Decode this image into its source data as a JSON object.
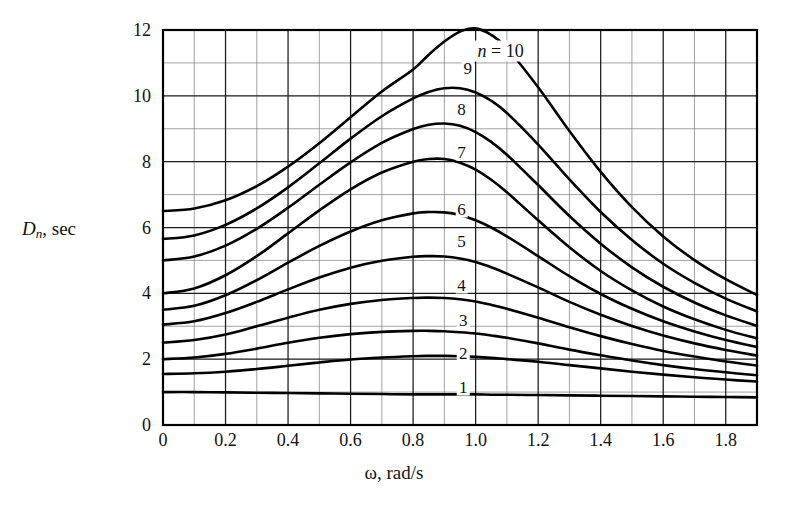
{
  "chart_data": {
    "type": "line",
    "title": "",
    "xlabel": "ω, rad/s",
    "ylabel": "D_n , sec",
    "ylabel_parts": {
      "symbol": "D",
      "subscript": "n",
      "unit": ", sec"
    },
    "xlim": [
      0,
      1.9
    ],
    "ylim": [
      0,
      12
    ],
    "x_major_step": 0.2,
    "x_minor_step": 0.1,
    "y_major_step": 2,
    "y_minor_step": 1,
    "grid": true,
    "grid_minor": true,
    "legend_position": "inline-curve-labels",
    "series_annotation": "n = 10",
    "xticks": [
      "0",
      "0.2",
      "0.4",
      "0.6",
      "0.8",
      "1.0",
      "1.2",
      "1.4",
      "1.6",
      "1.8"
    ],
    "xtick_values": [
      0,
      0.2,
      0.4,
      0.6,
      0.8,
      1.0,
      1.2,
      1.4,
      1.6,
      1.8
    ],
    "yticks": [
      "0",
      "2",
      "4",
      "6",
      "8",
      "10",
      "12"
    ],
    "ytick_values": [
      0,
      2,
      4,
      6,
      8,
      10,
      12
    ],
    "x": [
      0,
      0.1,
      0.2,
      0.3,
      0.4,
      0.5,
      0.6,
      0.7,
      0.8,
      0.85,
      0.9,
      0.95,
      1.0,
      1.05,
      1.1,
      1.2,
      1.3,
      1.4,
      1.5,
      1.6,
      1.7,
      1.8,
      1.9
    ],
    "series": [
      {
        "name": "1",
        "label": "1",
        "label_x": 0.96,
        "label_y": 1.15,
        "values": [
          1.0,
          1.0,
          0.99,
          0.98,
          0.97,
          0.96,
          0.95,
          0.94,
          0.93,
          0.93,
          0.93,
          0.93,
          0.93,
          0.92,
          0.92,
          0.91,
          0.9,
          0.89,
          0.88,
          0.87,
          0.86,
          0.85,
          0.84
        ]
      },
      {
        "name": "2",
        "label": "2",
        "label_x": 0.96,
        "label_y": 2.2,
        "values": [
          1.55,
          1.57,
          1.62,
          1.7,
          1.8,
          1.9,
          1.99,
          2.05,
          2.09,
          2.1,
          2.1,
          2.09,
          2.07,
          2.04,
          2.0,
          1.92,
          1.82,
          1.72,
          1.62,
          1.53,
          1.45,
          1.38,
          1.32
        ]
      },
      {
        "name": "3",
        "label": "3",
        "label_x": 0.96,
        "label_y": 3.2,
        "values": [
          2.0,
          2.05,
          2.16,
          2.32,
          2.5,
          2.65,
          2.76,
          2.83,
          2.86,
          2.86,
          2.85,
          2.82,
          2.78,
          2.72,
          2.65,
          2.48,
          2.29,
          2.12,
          1.96,
          1.82,
          1.7,
          1.6,
          1.51
        ]
      },
      {
        "name": "4",
        "label": "4",
        "label_x": 0.955,
        "label_y": 4.25,
        "values": [
          2.5,
          2.58,
          2.75,
          3.0,
          3.26,
          3.5,
          3.68,
          3.8,
          3.86,
          3.87,
          3.86,
          3.82,
          3.75,
          3.65,
          3.53,
          3.26,
          2.97,
          2.7,
          2.46,
          2.25,
          2.08,
          1.93,
          1.81
        ]
      },
      {
        "name": "5",
        "label": "5",
        "label_x": 0.955,
        "label_y": 5.6,
        "values": [
          3.05,
          3.15,
          3.4,
          3.74,
          4.12,
          4.48,
          4.78,
          4.99,
          5.11,
          5.13,
          5.12,
          5.06,
          4.95,
          4.79,
          4.6,
          4.18,
          3.74,
          3.35,
          3.01,
          2.72,
          2.48,
          2.28,
          2.11
        ]
      },
      {
        "name": "6",
        "label": "6",
        "label_x": 0.955,
        "label_y": 6.55,
        "values": [
          3.5,
          3.62,
          3.94,
          4.4,
          4.93,
          5.44,
          5.88,
          6.22,
          6.43,
          6.47,
          6.46,
          6.38,
          6.22,
          6.0,
          5.73,
          5.13,
          4.52,
          3.98,
          3.53,
          3.15,
          2.84,
          2.58,
          2.37
        ]
      },
      {
        "name": "7",
        "label": "7",
        "label_x": 0.955,
        "label_y": 8.3,
        "values": [
          4.0,
          4.15,
          4.55,
          5.13,
          5.82,
          6.52,
          7.16,
          7.67,
          8.0,
          8.08,
          8.08,
          7.97,
          7.76,
          7.45,
          7.07,
          6.22,
          5.4,
          4.68,
          4.09,
          3.6,
          3.21,
          2.89,
          2.63
        ]
      },
      {
        "name": "8",
        "label": "8",
        "label_x": 0.955,
        "label_y": 9.6,
        "values": [
          5.0,
          5.12,
          5.45,
          5.96,
          6.6,
          7.3,
          7.98,
          8.57,
          8.99,
          9.12,
          9.16,
          9.09,
          8.9,
          8.6,
          8.21,
          7.29,
          6.35,
          5.51,
          4.79,
          4.2,
          3.72,
          3.33,
          3.01
        ]
      },
      {
        "name": "9",
        "label": "9",
        "label_x": 0.975,
        "label_y": 10.85,
        "values": [
          5.65,
          5.76,
          6.08,
          6.58,
          7.22,
          7.95,
          8.7,
          9.38,
          9.92,
          10.12,
          10.23,
          10.23,
          10.1,
          9.85,
          9.48,
          8.52,
          7.46,
          6.47,
          5.62,
          4.9,
          4.32,
          3.84,
          3.45
        ]
      },
      {
        "name": "10",
        "label": "",
        "label_x": 0.99,
        "label_y": 12.35,
        "values": [
          6.5,
          6.58,
          6.83,
          7.26,
          7.85,
          8.56,
          9.35,
          10.13,
          10.8,
          11.25,
          11.65,
          11.95,
          12.05,
          11.85,
          11.45,
          10.26,
          8.93,
          7.69,
          6.62,
          5.73,
          5.01,
          4.43,
          3.95
        ]
      }
    ],
    "annotations": [
      {
        "text": "n = 10",
        "x": 1.08,
        "y": 11.35
      }
    ]
  },
  "meta": {
    "curve_label_names": [
      "1",
      "2",
      "3",
      "4",
      "5",
      "6",
      "7",
      "8",
      "9",
      "10"
    ]
  }
}
